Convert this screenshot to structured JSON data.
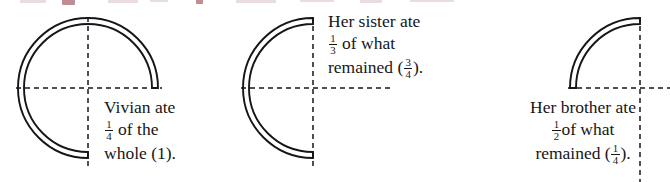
{
  "figure": {
    "background_color": "#ffffff",
    "ink_color": "#16161a",
    "bleed_color": "#8e2f3a"
  },
  "panels": [
    {
      "id": "panel-vivian",
      "shape": "ring-arc",
      "fraction_remaining": "3/4",
      "arc_start_deg": 0,
      "arc_sweep_deg": 270,
      "sweep_direction": "counterclockwise",
      "center": {
        "x": 88,
        "y": 88
      },
      "radius": 70,
      "ring_thickness": 6,
      "caption": {
        "lines": [
          {
            "pre": "Vivian ate",
            "frac": null,
            "post": ""
          },
          {
            "pre": "",
            "frac": {
              "num": "1",
              "den": "4"
            },
            "post": " of the"
          },
          {
            "pre": "whole (1).",
            "frac": null,
            "post": ""
          }
        ]
      }
    },
    {
      "id": "panel-sister",
      "shape": "ring-arc",
      "fraction_remaining": "1/2",
      "arc_start_deg": 90,
      "arc_sweep_deg": 180,
      "sweep_direction": "counterclockwise",
      "center": {
        "x": 313,
        "y": 88
      },
      "radius": 70,
      "ring_thickness": 6,
      "caption": {
        "lines": [
          {
            "pre": "Her sister ate",
            "frac": null,
            "post": ""
          },
          {
            "pre": "",
            "frac": {
              "num": "1",
              "den": "3"
            },
            "post": " of what"
          },
          {
            "pre": "remained (",
            "frac": {
              "num": "3",
              "den": "4"
            },
            "post": ")."
          }
        ]
      }
    },
    {
      "id": "panel-brother",
      "shape": "ring-arc",
      "fraction_remaining": "1/4",
      "arc_start_deg": 90,
      "arc_sweep_deg": 90,
      "sweep_direction": "counterclockwise",
      "center": {
        "x": 640,
        "y": 88
      },
      "radius": 70,
      "ring_thickness": 6,
      "caption": {
        "lines": [
          {
            "pre": "Her brother ate",
            "frac": null,
            "post": ""
          },
          {
            "pre": "",
            "frac": {
              "num": "1",
              "den": "2"
            },
            "post": "of what"
          },
          {
            "pre": "remained (",
            "frac": {
              "num": "1",
              "den": "4"
            },
            "post": ")."
          }
        ]
      }
    }
  ],
  "axes": {
    "style": "dashed",
    "color": "#16161a",
    "dash": "5 4",
    "width": 1.4,
    "baseline_y": 88,
    "vertical_lines_x": [
      88,
      313,
      640
    ],
    "horizontal_segments": [
      {
        "x1": 16,
        "x2": 162
      },
      {
        "x1": 241,
        "x2": 392
      },
      {
        "x1": 568,
        "x2": 670
      }
    ],
    "vertical_segments": [
      {
        "y1": 17,
        "y2": 166
      },
      {
        "y1": 17,
        "y2": 166
      },
      {
        "y1": 17,
        "y2": 182
      }
    ]
  },
  "captions_text": {
    "vivian": "Vivian ate 1/4 of the whole (1).",
    "sister": "Her sister ate 1/3 of what remained (3/4).",
    "brother": "Her brother ate 1/2 of what remained (1/4)."
  }
}
